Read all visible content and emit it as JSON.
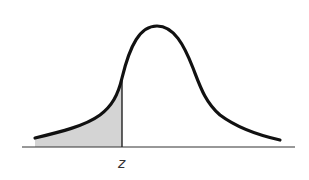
{
  "diagram": {
    "type": "normal-distribution-curve",
    "shaded_region": "left tail (area to the left of z)",
    "label_z": "z",
    "colors": {
      "curve": "#111111",
      "shade": "#d4d4d4",
      "axis": "#333333",
      "background": "#ffffff"
    }
  }
}
